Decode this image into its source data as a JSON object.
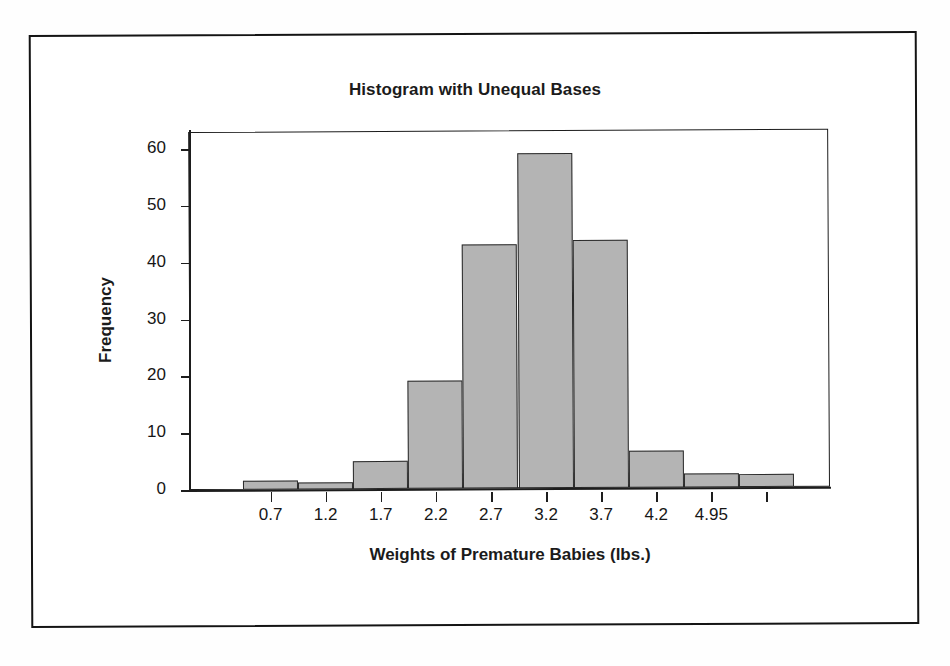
{
  "figure": {
    "kind": "scanned-textbook-figure",
    "border_color": "#141414",
    "background_color": "#ffffff"
  },
  "chart_data": {
    "type": "bar",
    "title": "Histogram with Unequal Bases",
    "xlabel": "Weights of Premature Babies (lbs.)",
    "ylabel": "Frequency",
    "categories": [
      "0.7",
      "1.2",
      "1.7",
      "2.2",
      "2.7",
      "3.2",
      "3.7",
      "4.2",
      "4.95",
      ""
    ],
    "tick_labels": [
      "0.7",
      "1.2",
      "1.7",
      "2.2",
      "2.7",
      "3.2",
      "3.7",
      "4.2",
      "4.95"
    ],
    "values": [
      1.5,
      1.2,
      5,
      19,
      43,
      59,
      43.7,
      6.5,
      2.5,
      2.3
    ],
    "bins": [
      {
        "label": "0.7",
        "left": 0.45,
        "right": 0.95,
        "width": 0.5,
        "frequency": 1.5
      },
      {
        "label": "1.2",
        "left": 0.95,
        "right": 1.45,
        "width": 0.5,
        "frequency": 1.2
      },
      {
        "label": "1.7",
        "left": 1.45,
        "right": 1.95,
        "width": 0.5,
        "frequency": 5
      },
      {
        "label": "2.2",
        "left": 1.95,
        "right": 2.45,
        "width": 0.5,
        "frequency": 19
      },
      {
        "label": "2.7",
        "left": 2.45,
        "right": 2.95,
        "width": 0.5,
        "frequency": 43
      },
      {
        "label": "3.2",
        "left": 2.95,
        "right": 3.45,
        "width": 0.5,
        "frequency": 59
      },
      {
        "label": "3.7",
        "left": 3.45,
        "right": 3.95,
        "width": 0.5,
        "frequency": 43.7
      },
      {
        "label": "4.2",
        "left": 3.95,
        "right": 4.45,
        "width": 0.5,
        "frequency": 6.5
      },
      {
        "label": "4.95",
        "left": 4.45,
        "right": 4.95,
        "width": 0.5,
        "frequency": 2.5
      },
      {
        "label": "",
        "left": 4.95,
        "right": 5.45,
        "width": 0.5,
        "frequency": 2.3
      }
    ],
    "yticks": [
      0,
      10,
      20,
      30,
      40,
      50,
      60
    ],
    "ytick_labels": [
      "0",
      "10",
      "20",
      "30",
      "40",
      "50",
      "60"
    ],
    "ylim": [
      0,
      63
    ],
    "grid": false,
    "legend": null,
    "bar_fill_color": "#b4b4b4",
    "bar_edge_color": "#2a2a2a",
    "axis_color": "#1d1d1d"
  }
}
